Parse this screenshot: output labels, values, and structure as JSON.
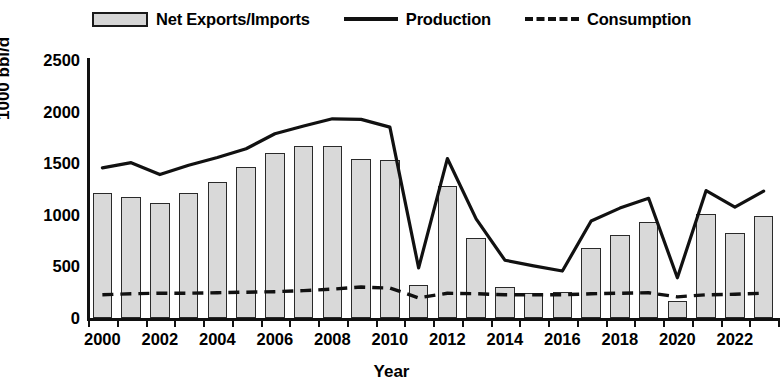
{
  "legend": {
    "items": [
      {
        "label": "Net Exports/Imports",
        "marker": "bar-swatch"
      },
      {
        "label": "Production",
        "marker": "solid-line-swatch"
      },
      {
        "label": "Consumption",
        "marker": "dashed-line-swatch"
      }
    ]
  },
  "axes": {
    "ylabel": "1000 bbl/d",
    "xlabel": "Year",
    "yticks": [
      0,
      500,
      1000,
      1500,
      2000,
      2500
    ],
    "xticks_labeled": [
      2000,
      2002,
      2004,
      2006,
      2008,
      2010,
      2012,
      2014,
      2016,
      2018,
      2020,
      2022
    ]
  },
  "colors": {
    "bar_fill": "#d9d9d9",
    "bar_stroke": "#2a2a2a",
    "production_line": "#111111",
    "consumption_line": "#111111",
    "axis": "#111111"
  },
  "chart_data": {
    "type": "bar",
    "title": "",
    "xlabel": "Year",
    "ylabel": "1000 bbl/d",
    "ylim": [
      0,
      2500
    ],
    "grid": false,
    "legend_position": "top-center",
    "categories": [
      2000,
      2001,
      2002,
      2003,
      2004,
      2005,
      2006,
      2007,
      2008,
      2009,
      2010,
      2011,
      2012,
      2013,
      2014,
      2015,
      2016,
      2017,
      2018,
      2019,
      2020,
      2021,
      2022,
      2023
    ],
    "series": [
      {
        "name": "Net Exports/Imports",
        "type": "bar",
        "values": [
          1210,
          1170,
          1110,
          1210,
          1320,
          1465,
          1600,
          1670,
          1670,
          1540,
          1530,
          320,
          1280,
          780,
          300,
          245,
          255,
          680,
          800,
          935,
          165,
          1010,
          820,
          985
        ]
      },
      {
        "name": "Production",
        "type": "line",
        "values": [
          1455,
          1505,
          1390,
          1480,
          1555,
          1640,
          1785,
          1860,
          1930,
          1925,
          1850,
          485,
          1545,
          960,
          560,
          505,
          455,
          940,
          1065,
          1160,
          390,
          1235,
          1075,
          1230
        ]
      },
      {
        "name": "Consumption",
        "type": "line",
        "values": [
          225,
          235,
          240,
          240,
          245,
          250,
          255,
          265,
          280,
          300,
          290,
          195,
          240,
          235,
          225,
          225,
          225,
          235,
          240,
          245,
          205,
          225,
          230,
          240
        ]
      }
    ]
  }
}
